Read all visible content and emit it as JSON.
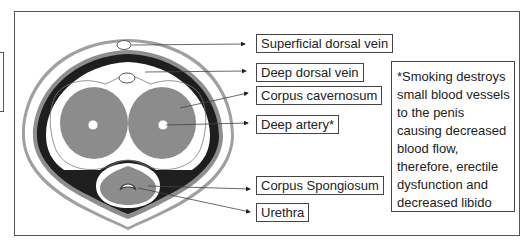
{
  "diagram": {
    "labels": [
      {
        "id": "superficial-dorsal-vein",
        "text": "Superficial dorsal vein"
      },
      {
        "id": "deep-dorsal-vein",
        "text": "Deep dorsal vein"
      },
      {
        "id": "corpus-cavernosum",
        "text": "Corpus cavernosum"
      },
      {
        "id": "deep-artery",
        "text": "Deep artery*"
      },
      {
        "id": "corpus-spongiosum",
        "text": "Corpus Spongiosum"
      },
      {
        "id": "urethra",
        "text": "Urethra"
      }
    ],
    "note": {
      "lines": [
        "*Smoking destroys",
        "small blood vessels",
        "to the penis",
        "causing decreased",
        "blood flow,",
        "therefore, erectile",
        "dysfunction and",
        "decreased libido"
      ]
    },
    "colors": {
      "outer_skin": "#9a9a9a",
      "dark_layer": "#1e1e1e",
      "tissue": "#8c8c8c",
      "background": "#ffffff",
      "border": "#555555"
    }
  }
}
